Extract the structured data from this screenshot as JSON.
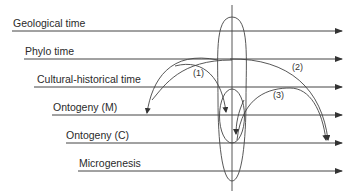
{
  "diagram": {
    "timelines": [
      {
        "label": "Geological time",
        "y": 31,
        "x_start": 12
      },
      {
        "label": "Phylo time",
        "y": 59,
        "x_start": 24
      },
      {
        "label": "Cultural-historical time",
        "y": 87,
        "x_start": 34
      },
      {
        "label": "Ontogeny (M)",
        "y": 115,
        "x_start": 52
      },
      {
        "label": "Ontogeny (C)",
        "y": 143,
        "x_start": 66
      },
      {
        "label": "Microgenesis",
        "y": 171,
        "x_start": 78
      }
    ],
    "arc_labels": [
      "(1)",
      "(2)",
      "(3)"
    ],
    "colors": {
      "line": "#333333",
      "text": "#2a2a2a",
      "background": "#ffffff"
    }
  }
}
